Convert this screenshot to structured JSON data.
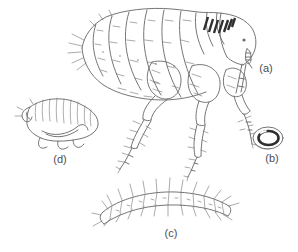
{
  "figure": {
    "colors": {
      "bg": "#ffffff",
      "line": "#6e6e6e",
      "dark": "#2f2f2f",
      "label": "#4d4d4d"
    },
    "labels": {
      "a": "(a)",
      "b": "(b)",
      "c": "(c)",
      "d": "(d)"
    }
  }
}
